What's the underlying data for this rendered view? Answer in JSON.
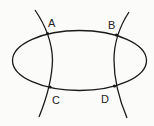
{
  "diagram": {
    "stroke_color": "#1a1a1a",
    "points": [
      {
        "label": "A",
        "x": 47.5,
        "y": 33.5
      },
      {
        "label": "B",
        "x": 116.5,
        "y": 35
      },
      {
        "label": "C",
        "x": 50,
        "y": 87
      },
      {
        "label": "D",
        "x": 114.5,
        "y": 86
      }
    ],
    "labels": {
      "A": "A",
      "B": "B",
      "C": "C",
      "D": "D"
    }
  }
}
